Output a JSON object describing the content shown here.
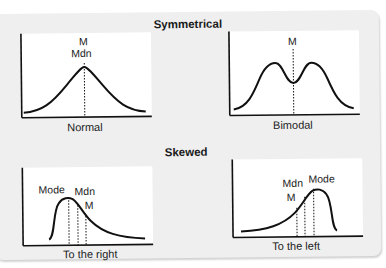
{
  "sections": [
    {
      "title": "Symmetrical",
      "panels": [
        {
          "caption": "Normal",
          "shape": "normal",
          "markers": [
            {
              "labels": [
                "M",
                "Mdn"
              ]
            }
          ]
        },
        {
          "caption": "Bimodal",
          "shape": "bimodal",
          "markers": [
            {
              "labels": [
                "M"
              ]
            }
          ]
        }
      ]
    },
    {
      "title": "Skewed",
      "panels": [
        {
          "caption": "To the right",
          "shape": "right-skewed",
          "markers": [
            {
              "labels": [
                "Mode"
              ]
            },
            {
              "labels": [
                "Mdn"
              ]
            },
            {
              "labels": [
                "M"
              ]
            }
          ]
        },
        {
          "caption": "To the left",
          "shape": "left-skewed",
          "markers": [
            {
              "labels": [
                "M"
              ]
            },
            {
              "labels": [
                "Mdn"
              ]
            },
            {
              "labels": [
                "Mode"
              ]
            }
          ]
        }
      ]
    }
  ],
  "colors": {
    "card_background": "#efefef",
    "panel_background": "#ffffff",
    "curve": "#111111"
  }
}
